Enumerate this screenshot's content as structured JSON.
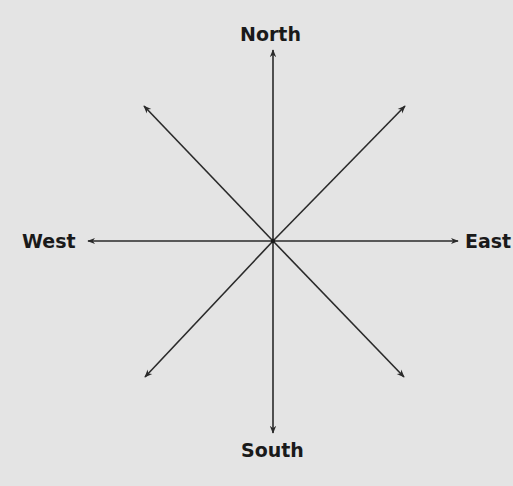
{
  "diagram": {
    "background": "#e4e4e4",
    "line_color": "#2a2a2a",
    "center": [
      273,
      241
    ],
    "labels": {
      "north": "North",
      "south": "South",
      "east": "East",
      "west": "West"
    },
    "arrows": [
      {
        "name": "north",
        "tip": [
          273,
          50
        ]
      },
      {
        "name": "south",
        "tip": [
          273,
          433
        ]
      },
      {
        "name": "east",
        "tip": [
          458,
          241
        ]
      },
      {
        "name": "west",
        "tip": [
          88,
          241
        ]
      },
      {
        "name": "northeast",
        "tip": [
          405,
          106
        ]
      },
      {
        "name": "northwest",
        "tip": [
          144,
          106
        ]
      },
      {
        "name": "southeast",
        "tip": [
          404,
          377
        ]
      },
      {
        "name": "southwest",
        "tip": [
          145,
          377
        ]
      }
    ]
  }
}
